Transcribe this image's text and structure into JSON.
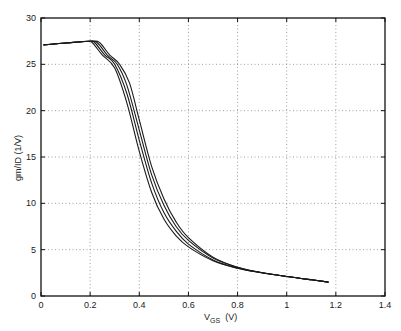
{
  "chart_data": {
    "type": "line",
    "title": "",
    "xlabel": "V_GS (V)",
    "xlabel_main": "V",
    "xlabel_sub": "GS",
    "xlabel_unit": "(V)",
    "ylabel": "gm/ID  (1/V)",
    "xlim": [
      0,
      1.4
    ],
    "ylim": [
      0,
      30
    ],
    "xticks": [
      "0",
      "0.2",
      "0.4",
      "0.6",
      "0.8",
      "1",
      "1.2",
      "1.4"
    ],
    "yticks": [
      "0",
      "5",
      "10",
      "15",
      "20",
      "25",
      "30"
    ],
    "grid": true,
    "legend": null,
    "series": [
      {
        "name": "curve 1",
        "x": [
          0.01,
          0.1,
          0.19,
          0.21,
          0.25,
          0.3,
          0.35,
          0.4,
          0.45,
          0.5,
          0.55,
          0.6,
          0.7,
          0.8,
          0.9,
          1.0,
          1.1,
          1.17
        ],
        "y": [
          27.1,
          27.3,
          27.5,
          27.3,
          26.0,
          24.6,
          20.8,
          15.6,
          11.2,
          8.3,
          6.5,
          5.3,
          3.8,
          3.0,
          2.5,
          2.1,
          1.75,
          1.5
        ]
      },
      {
        "name": "curve 2",
        "x": [
          0.01,
          0.1,
          0.2,
          0.22,
          0.26,
          0.3,
          0.35,
          0.4,
          0.45,
          0.5,
          0.55,
          0.6,
          0.7,
          0.8,
          0.9,
          1.0,
          1.1,
          1.17
        ],
        "y": [
          27.1,
          27.3,
          27.5,
          27.3,
          26.0,
          25.0,
          21.8,
          16.8,
          12.2,
          9.0,
          7.0,
          5.6,
          3.9,
          3.0,
          2.5,
          2.1,
          1.75,
          1.5
        ]
      },
      {
        "name": "curve 3",
        "x": [
          0.01,
          0.1,
          0.2,
          0.23,
          0.27,
          0.31,
          0.35,
          0.4,
          0.45,
          0.5,
          0.55,
          0.6,
          0.7,
          0.8,
          0.9,
          1.0,
          1.1,
          1.17
        ],
        "y": [
          27.1,
          27.3,
          27.5,
          27.3,
          26.0,
          25.0,
          22.7,
          17.9,
          13.1,
          9.8,
          7.5,
          6.0,
          4.1,
          3.1,
          2.5,
          2.1,
          1.75,
          1.5
        ]
      },
      {
        "name": "curve 4",
        "x": [
          0.01,
          0.1,
          0.21,
          0.24,
          0.28,
          0.32,
          0.36,
          0.4,
          0.45,
          0.5,
          0.55,
          0.6,
          0.7,
          0.8,
          0.9,
          1.0,
          1.1,
          1.17
        ],
        "y": [
          27.1,
          27.3,
          27.5,
          27.3,
          26.0,
          25.0,
          23.0,
          19.0,
          14.0,
          10.5,
          8.0,
          6.3,
          4.2,
          3.1,
          2.5,
          2.1,
          1.75,
          1.5
        ]
      }
    ],
    "line_color": "#1a1a1a",
    "grid_color": "#888888"
  }
}
